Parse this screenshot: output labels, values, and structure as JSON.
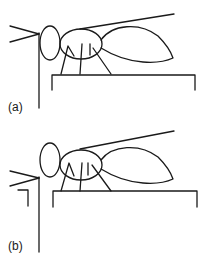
{
  "figure": {
    "panels": [
      {
        "id": "a",
        "label": "(a)"
      },
      {
        "id": "b",
        "label": "(b)"
      }
    ]
  },
  "colors": {
    "stroke": "#1a1a1a",
    "background": "#ffffff"
  }
}
